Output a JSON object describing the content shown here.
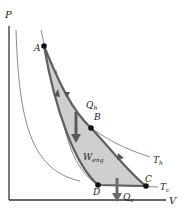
{
  "diagram": {
    "type": "carnot-cycle-pv",
    "axes": {
      "y_label": "P",
      "x_label": "V"
    },
    "points": [
      {
        "label": "A",
        "x": 44,
        "y": 46
      },
      {
        "label": "B",
        "x": 91,
        "y": 128
      },
      {
        "label": "C",
        "x": 146,
        "y": 186
      },
      {
        "label": "D",
        "x": 98,
        "y": 185
      }
    ],
    "isotherms": {
      "hot": {
        "label": "T",
        "sub": "h"
      },
      "cold": {
        "label": "T",
        "sub": "c"
      }
    },
    "heat_in": {
      "label": "Q",
      "sub": "h"
    },
    "heat_out": {
      "label": "Q",
      "sub": "c"
    },
    "work": {
      "label": "W",
      "sub": "eng"
    },
    "colors": {
      "axis": "#333333",
      "cycle_stroke": "#606060",
      "cycle_fill": "#cfcfcf",
      "isotherm": "#8a8a8a",
      "arrow": "#5a5a5a",
      "point": "#111111"
    }
  }
}
